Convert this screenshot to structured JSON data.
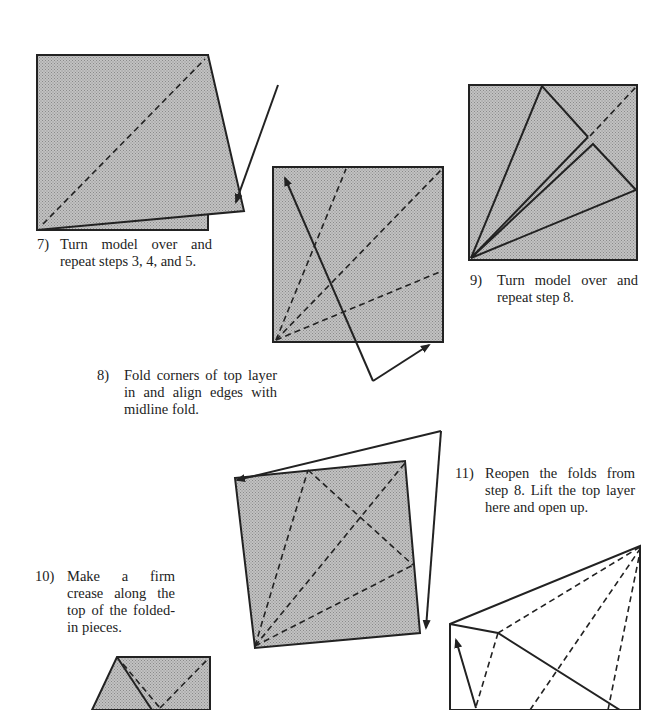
{
  "colors": {
    "paper_fill": "#b4b4b4",
    "line": "#222222",
    "background": "#ffffff"
  },
  "steps": [
    {
      "number": "7)",
      "text": "Turn model over and repeat steps 3, 4, and 5."
    },
    {
      "number": "8)",
      "text": "Fold corners of top layer in and align edges with midline fold."
    },
    {
      "number": "9)",
      "text": "Turn model over and repeat step 8."
    },
    {
      "number": "10)",
      "text": "Make a firm crease along the top of the folded-in pieces."
    },
    {
      "number": "11)",
      "text": "Reopen the folds from step 8. Lift the top layer here and open up."
    }
  ],
  "diagrams": [
    {
      "step": "7",
      "description": "square folded along diagonal with arrow pointing to lower-right corner"
    },
    {
      "step": "8",
      "description": "square with three dashed fold lines from lower-left corner and arrows"
    },
    {
      "step": "9",
      "description": "kite shape with corners folded in toward midline"
    },
    {
      "step": "10",
      "description": "tilted square with dashed crease lines and arrows"
    },
    {
      "step": "11",
      "description": "opened layer outline with dashed lines and lift arrow"
    }
  ]
}
